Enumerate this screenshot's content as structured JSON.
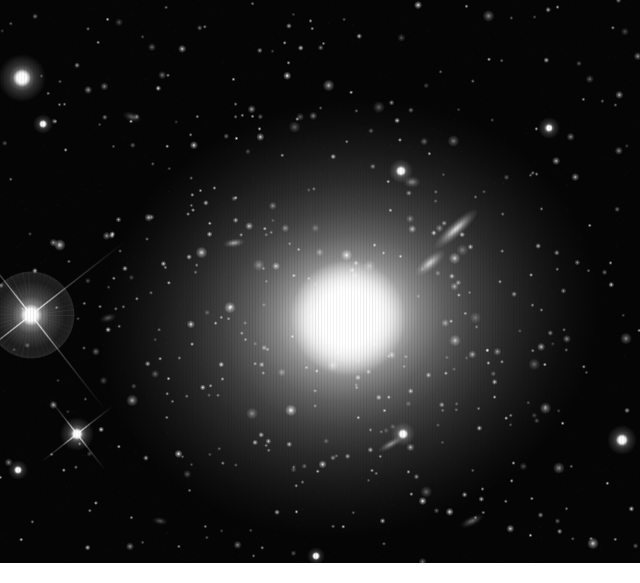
{
  "image": {
    "kind": "astronomical-photograph",
    "medium": "grayscale-ccd-image",
    "frame": {
      "x": 0,
      "y": 0,
      "width": 640,
      "height": 563
    },
    "canvas": {
      "width": 640,
      "height": 583
    },
    "background_margin": {
      "color": "#ffffff",
      "y": 563,
      "height": 20
    },
    "palette": {
      "sky_background": "#050505",
      "faint_halo": "#3a3a3a",
      "mid_halo": "#9a9a9a",
      "core": "#ffffff",
      "star": "#ffffff",
      "margin": "#ffffff"
    },
    "render": {
      "star_count": 620,
      "noise_grain_count": 2600,
      "dither_stripe_spacing": 3,
      "dither_stripe_alpha": 0.06,
      "random_seed": 20240917
    }
  },
  "objects": {
    "primary_galaxy": {
      "name": "giant-elliptical-galaxy",
      "center_x": 348,
      "center_y": 318,
      "core_radius": 34,
      "halo_radius_x": 252,
      "halo_radius_y": 218,
      "rotation_deg": -12,
      "brightness": 1.0
    },
    "companions": [
      {
        "name": "edge-on-spiral-galaxy",
        "center_x": 456,
        "center_y": 229,
        "length": 58,
        "width": 15,
        "rotation_deg": -42,
        "brightness": 0.82
      },
      {
        "name": "lenticular-companion-galaxy",
        "center_x": 430,
        "center_y": 263,
        "length": 38,
        "width": 14,
        "rotation_deg": -40,
        "brightness": 0.72
      },
      {
        "name": "small-elongated-galaxy-west",
        "center_x": 234,
        "center_y": 243,
        "length": 22,
        "width": 9,
        "rotation_deg": -8,
        "brightness": 0.58
      },
      {
        "name": "edge-on-galaxy-southeast",
        "center_x": 391,
        "center_y": 444,
        "length": 30,
        "width": 9,
        "rotation_deg": -30,
        "brightness": 0.5
      },
      {
        "name": "faint-galaxy-south",
        "center_x": 472,
        "center_y": 521,
        "length": 26,
        "width": 10,
        "rotation_deg": -25,
        "brightness": 0.38
      },
      {
        "name": "faint-galaxy-northwest",
        "center_x": 132,
        "center_y": 117,
        "length": 20,
        "width": 10,
        "rotation_deg": 18,
        "brightness": 0.34
      },
      {
        "name": "faint-galaxy-northeast",
        "center_x": 412,
        "center_y": 182,
        "length": 18,
        "width": 12,
        "rotation_deg": 0,
        "brightness": 0.45
      },
      {
        "name": "faint-galaxy-west-edge",
        "center_x": 108,
        "center_y": 318,
        "length": 18,
        "width": 9,
        "rotation_deg": -15,
        "brightness": 0.3
      },
      {
        "name": "faint-galaxy-far-southwest",
        "center_x": 160,
        "center_y": 521,
        "length": 16,
        "width": 8,
        "rotation_deg": 10,
        "brightness": 0.3
      }
    ],
    "bright_stars": [
      {
        "name": "foreground-star-with-ghost-halo",
        "center_x": 31,
        "center_y": 315,
        "core_radius": 11,
        "glow_radius": 34,
        "ghost_radius": 44,
        "spikes": true,
        "spike_length": 120,
        "spike_angle_deg": 52,
        "brightness": 1.0
      },
      {
        "name": "bright-star-northwest",
        "center_x": 22,
        "center_y": 78,
        "core_radius": 9,
        "glow_radius": 24,
        "spikes": false,
        "brightness": 0.95
      },
      {
        "name": "bright-star-southwest",
        "center_x": 77,
        "center_y": 434,
        "core_radius": 6,
        "glow_radius": 17,
        "spikes": true,
        "spike_length": 46,
        "spike_angle_deg": 52,
        "brightness": 0.9
      },
      {
        "name": "bright-star-north-central",
        "center_x": 401,
        "center_y": 171,
        "core_radius": 5,
        "glow_radius": 12,
        "spikes": false,
        "brightness": 0.85
      },
      {
        "name": "bright-star-southeast",
        "center_x": 403,
        "center_y": 434,
        "core_radius": 5,
        "glow_radius": 12,
        "spikes": false,
        "brightness": 0.8
      },
      {
        "name": "bright-star-east-edge",
        "center_x": 622,
        "center_y": 440,
        "core_radius": 6,
        "glow_radius": 15,
        "spikes": false,
        "brightness": 0.82
      },
      {
        "name": "bright-star-north-edge",
        "center_x": 549,
        "center_y": 128,
        "core_radius": 4,
        "glow_radius": 11,
        "spikes": false,
        "brightness": 0.75
      },
      {
        "name": "bright-star-far-northwest",
        "center_x": 43,
        "center_y": 124,
        "core_radius": 4,
        "glow_radius": 10,
        "spikes": false,
        "brightness": 0.72
      },
      {
        "name": "bright-star-west-low",
        "center_x": 18,
        "center_y": 470,
        "core_radius": 4,
        "glow_radius": 10,
        "spikes": false,
        "brightness": 0.7
      },
      {
        "name": "bright-star-south-central",
        "center_x": 316,
        "center_y": 556,
        "core_radius": 4,
        "glow_radius": 9,
        "spikes": false,
        "brightness": 0.68
      }
    ]
  },
  "chart_data": {
    "type": "scatter",
    "title": "",
    "xlabel": "",
    "ylabel": "",
    "xlim": [
      0,
      640
    ],
    "ylim": [
      0,
      563
    ],
    "grid": false,
    "legend": "none"
  }
}
